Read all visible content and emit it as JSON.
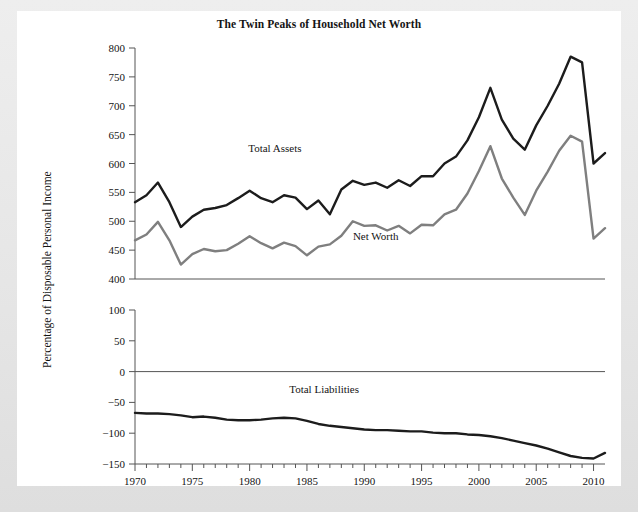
{
  "page": {
    "background_color": "#e9e9e9",
    "card_color": "#ffffff"
  },
  "chart_data": {
    "type": "line",
    "title": "The Twin Peaks of Household Net Worth",
    "xlabel": "",
    "ylabel": "Percentage of Disposable Personal Income",
    "grid": false,
    "legend_position": "inline-annotation",
    "panels": [
      {
        "name": "upper-panel",
        "ylim": [
          400,
          800
        ],
        "yticks": [
          400,
          450,
          500,
          550,
          600,
          650,
          700,
          750,
          800
        ],
        "ytick_labels": [
          "400",
          "450",
          "500",
          "550",
          "600",
          "650",
          "700",
          "750",
          "800"
        ],
        "series": [
          {
            "name": "Total Assets",
            "color": "#1c1c1c",
            "width": 2.4,
            "label_x": 1982.2,
            "label_y": 620,
            "values": [
              533,
              545,
              567,
              533,
              490,
              508,
              520,
              523,
              528,
              540,
              553,
              540,
              533,
              545,
              541,
              521,
              536,
              512,
              555,
              570,
              563,
              567,
              558,
              571,
              561,
              578,
              578,
              600,
              612,
              640,
              680,
              731,
              676,
              643,
              624,
              666,
              700,
              738,
              785,
              775,
              600,
              618
            ]
          },
          {
            "name": "Net Worth",
            "color": "#7f7f7f",
            "width": 2.4,
            "label_x": 1991.0,
            "label_y": 468,
            "values": [
              467,
              477,
              499,
              467,
              425,
              443,
              452,
              448,
              450,
              461,
              474,
              462,
              453,
              463,
              457,
              441,
              456,
              460,
              475,
              500,
              492,
              493,
              484,
              492,
              479,
              494,
              493,
              512,
              520,
              548,
              587,
              630,
              574,
              541,
              511,
              553,
              586,
              622,
              648,
              638,
              470,
              488
            ]
          }
        ]
      },
      {
        "name": "lower-panel",
        "ylim": [
          -150,
          100
        ],
        "yticks": [
          -150,
          -100,
          -50,
          0,
          50,
          100
        ],
        "ytick_labels": [
          "−150",
          "−100",
          "−50",
          "0",
          "50",
          "100"
        ],
        "zero_line": 0,
        "series": [
          {
            "name": "Total Liabilities",
            "color": "#1c1c1c",
            "width": 2.4,
            "label_x": 1986.5,
            "label_y": -35,
            "values": [
              -67,
              -68,
              -68,
              -69,
              -71,
              -74,
              -73,
              -75,
              -78,
              -79,
              -79,
              -78,
              -76,
              -75,
              -76,
              -80,
              -85,
              -88,
              -90,
              -92,
              -94,
              -95,
              -95,
              -96,
              -97,
              -97,
              -99,
              -100,
              -100,
              -102,
              -103,
              -105,
              -108,
              -112,
              -116,
              -120,
              -125,
              -131,
              -137,
              -140,
              -141,
              -132
            ]
          }
        ]
      }
    ],
    "x": {
      "start": 1970,
      "end": 2011,
      "major_ticks": [
        1970,
        1975,
        1980,
        1985,
        1990,
        1995,
        2000,
        2005,
        2010
      ],
      "major_tick_labels": [
        "1970",
        "1975",
        "1980",
        "1985",
        "1990",
        "1995",
        "2000",
        "2005",
        "2010"
      ],
      "minor_tick_step": 1
    }
  }
}
